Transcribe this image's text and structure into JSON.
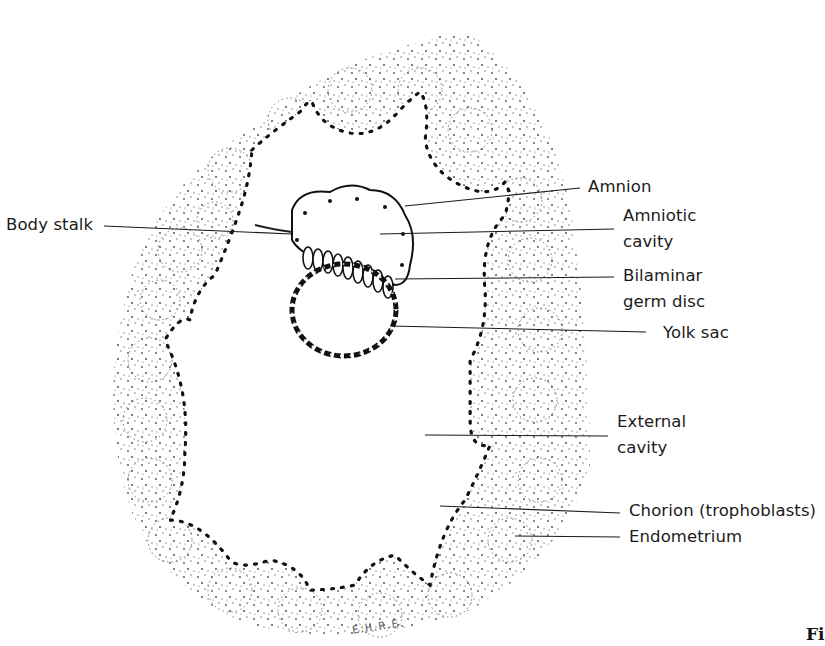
{
  "figure": {
    "caption_fragment": "Fi",
    "artist_signature": "E.H.R.E."
  },
  "labels": {
    "body_stalk": "Body stalk",
    "amnion": "Amnion",
    "amniotic_cavity_1": "Amniotic",
    "amniotic_cavity_2": "cavity",
    "bilaminar_1": "Bilaminar",
    "bilaminar_2": "germ disc",
    "yolk_sac": "Yolk sac",
    "external_cavity_1": "External",
    "external_cavity_2": "cavity",
    "chorion": "Chorion (trophoblasts)",
    "endometrium": "Endometrium"
  },
  "colors": {
    "ink": "#111111",
    "stipple": "#333333",
    "background": "#ffffff"
  }
}
